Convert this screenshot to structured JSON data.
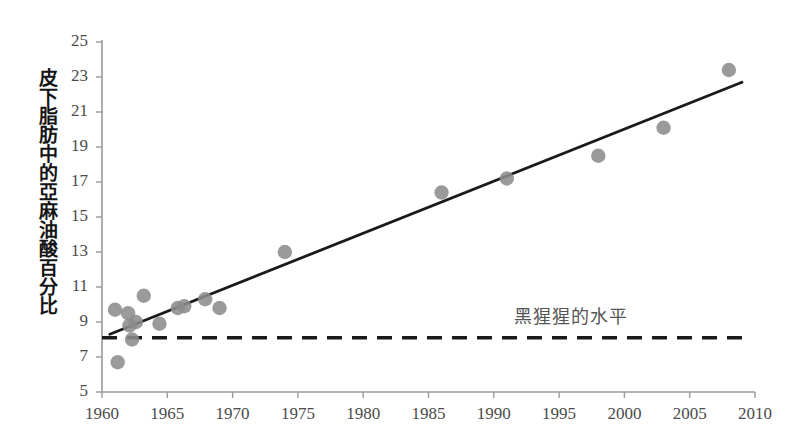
{
  "chart_data": {
    "type": "scatter",
    "title": "",
    "xlabel": "",
    "ylabel": "皮下脂肪中的亞麻油酸百分比",
    "xlim": [
      1960,
      2010
    ],
    "ylim": [
      5,
      25
    ],
    "xticks": [
      1960,
      1965,
      1970,
      1975,
      1980,
      1985,
      1990,
      1995,
      2000,
      2005,
      2010
    ],
    "yticks": [
      5,
      7,
      9,
      11,
      13,
      15,
      17,
      19,
      21,
      23,
      25
    ],
    "grid": false,
    "legend": "none",
    "point_color": "#8c8c8c",
    "trendline_color": "#1a1a1a",
    "refline_color": "#1a1a1a",
    "axis_color": "#9a9a9a",
    "series": [
      {
        "name": "皮下脂肪中的亞麻油酸百分比",
        "points": [
          {
            "x": 1961.0,
            "y": 9.7
          },
          {
            "x": 1961.2,
            "y": 6.7
          },
          {
            "x": 1962.0,
            "y": 9.5
          },
          {
            "x": 1962.1,
            "y": 8.8
          },
          {
            "x": 1962.3,
            "y": 8.0
          },
          {
            "x": 1962.6,
            "y": 9.0
          },
          {
            "x": 1963.2,
            "y": 10.5
          },
          {
            "x": 1964.4,
            "y": 8.9
          },
          {
            "x": 1965.8,
            "y": 9.8
          },
          {
            "x": 1966.3,
            "y": 9.9
          },
          {
            "x": 1967.9,
            "y": 10.3
          },
          {
            "x": 1969.0,
            "y": 9.8
          },
          {
            "x": 1974.0,
            "y": 13.0
          },
          {
            "x": 1986.0,
            "y": 16.4
          },
          {
            "x": 1991.0,
            "y": 17.2
          },
          {
            "x": 1998.0,
            "y": 18.5
          },
          {
            "x": 2003.0,
            "y": 20.1
          },
          {
            "x": 2008.0,
            "y": 23.4
          }
        ]
      }
    ],
    "trendline": {
      "x1": 1960.6,
      "y1": 8.3,
      "x2": 2009.0,
      "y2": 22.7
    },
    "reference_line": {
      "value": 8.1,
      "style": "dashed",
      "label": "黑猩猩的水平",
      "label_x": 1996.0,
      "label_y": 9.4
    }
  }
}
